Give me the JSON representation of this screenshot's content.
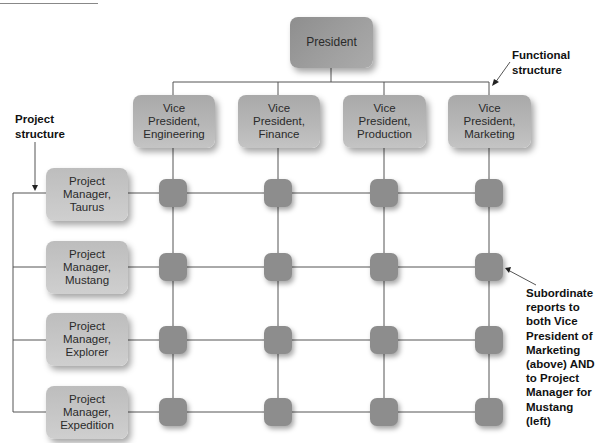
{
  "top": {
    "president": "President"
  },
  "vice_presidents": [
    {
      "line1": "Vice",
      "line2": "President,",
      "line3": "Engineering"
    },
    {
      "line1": "Vice",
      "line2": "President,",
      "line3": "Finance"
    },
    {
      "line1": "Vice",
      "line2": "President,",
      "line3": "Production"
    },
    {
      "line1": "Vice",
      "line2": "President,",
      "line3": "Marketing"
    }
  ],
  "project_managers": [
    {
      "line1": "Project",
      "line2": "Manager,",
      "line3": "Taurus"
    },
    {
      "line1": "Project",
      "line2": "Manager,",
      "line3": "Mustang"
    },
    {
      "line1": "Project",
      "line2": "Manager,",
      "line3": "Explorer"
    },
    {
      "line1": "Project",
      "line2": "Manager,",
      "line3": "Expedition"
    }
  ],
  "annotations": {
    "functional": {
      "line1": "Functional",
      "line2": "structure"
    },
    "project": {
      "line1": "Project",
      "line2": "structure"
    },
    "subordinate": {
      "lines": [
        "Subordinate",
        "reports to",
        "both Vice",
        "President of",
        "Marketing",
        "(above) AND",
        "to Project",
        "Manager for",
        "Mustang (left)"
      ]
    }
  },
  "colors": {
    "box_fill": "#b3b3b3",
    "president_fill": "#999999",
    "node_fill": "#8d8d8d",
    "line": "#555555"
  }
}
